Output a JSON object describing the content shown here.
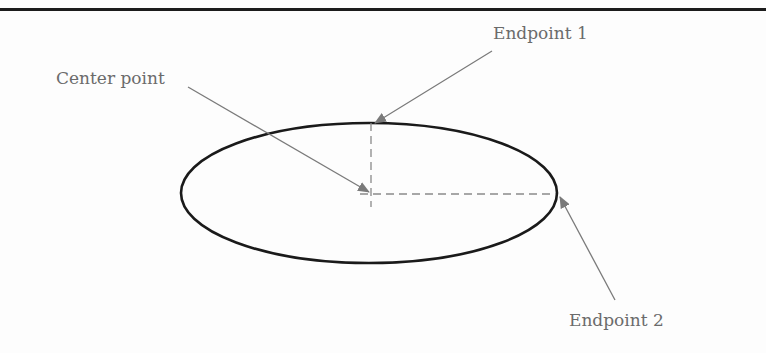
{
  "diagram": {
    "type": "ellipse-construction",
    "labels": {
      "center_point": "Center point",
      "endpoint_1": "Endpoint 1",
      "endpoint_2": "Endpoint 2"
    },
    "colors": {
      "ellipse_stroke": "#1a1a1a",
      "leader_arrow": "#7a7a7a",
      "dashed_axis": "#8a8a8a",
      "label_text": "#6b6b6b",
      "top_rule": "#1c1c1c"
    },
    "ellipse": {
      "cx": 369,
      "cy": 193,
      "rx": 188,
      "ry": 70
    },
    "axes": {
      "vertical": {
        "x": 371,
        "y1": 123,
        "y2": 207
      },
      "horizontal": {
        "y": 194,
        "x1": 360,
        "x2": 556
      }
    },
    "arrows": [
      {
        "name": "center-point-arrow",
        "from": [
          188,
          87
        ],
        "to": [
          369,
          192
        ]
      },
      {
        "name": "endpoint-1-arrow",
        "from": [
          492,
          51
        ],
        "to": [
          375,
          123
        ]
      },
      {
        "name": "endpoint-2-arrow",
        "from": [
          615,
          300
        ],
        "to": [
          560,
          197
        ]
      }
    ]
  }
}
